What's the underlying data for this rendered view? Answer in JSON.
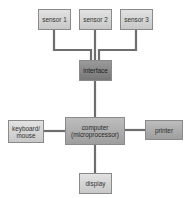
{
  "diagram": {
    "nodes": {
      "sensor1": {
        "label": "sensor 1"
      },
      "sensor2": {
        "label": "sensor 2"
      },
      "sensor3": {
        "label": "sensor 3"
      },
      "interface": {
        "label": "interface"
      },
      "computer": {
        "line1": "computer",
        "line2": "(microprocessor)"
      },
      "keyboard": {
        "line1": "keyboard/",
        "line2": "mouse"
      },
      "printer": {
        "label": "printer"
      },
      "display": {
        "label": "display"
      }
    },
    "edges": [
      [
        "sensor 1",
        "interface"
      ],
      [
        "sensor 2",
        "interface"
      ],
      [
        "sensor 3",
        "interface"
      ],
      [
        "interface",
        "computer (microprocessor)"
      ],
      [
        "keyboard/mouse",
        "computer (microprocessor)"
      ],
      [
        "computer (microprocessor)",
        "printer"
      ],
      [
        "computer (microprocessor)",
        "display"
      ]
    ],
    "colors": {
      "line": "#6e6e6e",
      "box_border": "#8a8a8a"
    }
  }
}
